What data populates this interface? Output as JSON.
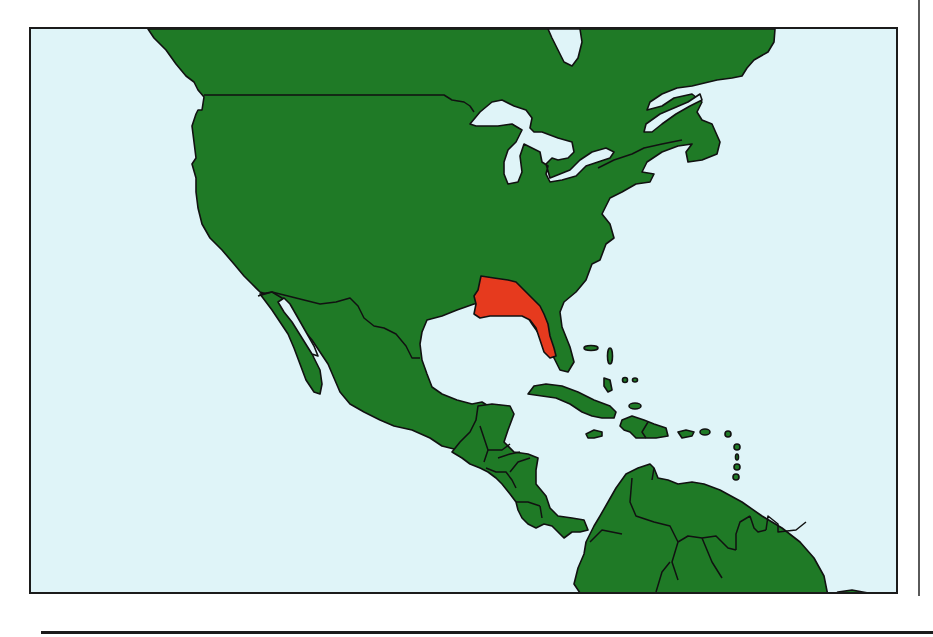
{
  "map": {
    "title": "North America, Central America and the Caribbean — highlighted region",
    "colors": {
      "ocean": "#dff4f8",
      "land": "#1f7a26",
      "highlight": "#e63a1e",
      "border": "#111111",
      "frame": "#1b1b1b"
    },
    "regions": [
      {
        "name": "Canada",
        "highlighted": false
      },
      {
        "name": "United States",
        "highlighted": false
      },
      {
        "name": "Southeastern United States (Georgia / Alabama / Florida panhandle)",
        "highlighted": true
      },
      {
        "name": "Mexico",
        "highlighted": false
      },
      {
        "name": "Central America",
        "highlighted": false
      },
      {
        "name": "Caribbean islands",
        "highlighted": false
      },
      {
        "name": "Northern South America",
        "highlighted": false
      }
    ],
    "features": [
      "Great Lakes",
      "Hudson Bay",
      "Gulf of Mexico",
      "Gulf of California",
      "Caribbean Sea",
      "Atlantic Ocean",
      "Pacific Ocean"
    ]
  }
}
